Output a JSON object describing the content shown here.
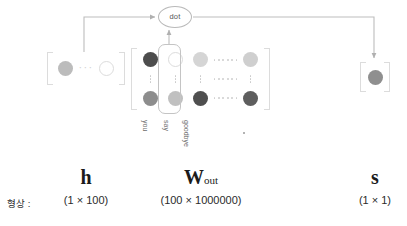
{
  "diagram": {
    "operation_node": {
      "label": "dot"
    },
    "shape_row_label": "형상 :",
    "vectors": {
      "h": {
        "name": "h",
        "shape": "(1 × 100)",
        "ellipsis": "···"
      },
      "w_out": {
        "name": "W",
        "subscript": "out",
        "shape": "(100 × 1000000)",
        "column_labels": [
          "you",
          "say",
          "goodbye"
        ],
        "column_label_dot": "·"
      },
      "s": {
        "name": "s",
        "shape": "(1 × 1)"
      }
    },
    "colors": {
      "node_dark": "#595959",
      "node_mid": "#8f8f8f",
      "node_light": "#c9c9c9",
      "node_lighter": "#d8d8d8",
      "node_outline": "#ffffff",
      "bracket": "#dcdcdc",
      "wire": "#b5b5b5",
      "highlight_border": "#c4c4c4",
      "text": "#1b1b1b"
    },
    "matrix_cells": [
      [
        {
          "type": "node",
          "fill": "#4d4d4d",
          "size": 15
        },
        {
          "type": "node-outline",
          "fill": "#ffffff",
          "size": 15
        },
        {
          "type": "node",
          "fill": "#d5d5d5",
          "size": 15
        },
        {
          "type": "hdots"
        },
        {
          "type": "node",
          "fill": "#cfcfcf",
          "size": 15
        }
      ],
      [
        {
          "type": "vdots"
        },
        {
          "type": "vdots"
        },
        {
          "type": "vdots"
        },
        {
          "type": "hdots"
        },
        {
          "type": "vdots"
        }
      ],
      [
        {
          "type": "node",
          "fill": "#8d8d8d",
          "size": 15
        },
        {
          "type": "node",
          "fill": "#c0c0c0",
          "size": 15
        },
        {
          "type": "node",
          "fill": "#4f4f4f",
          "size": 15
        },
        {
          "type": "hdots"
        },
        {
          "type": "node",
          "fill": "#5e5e5e",
          "size": 15
        }
      ]
    ]
  }
}
